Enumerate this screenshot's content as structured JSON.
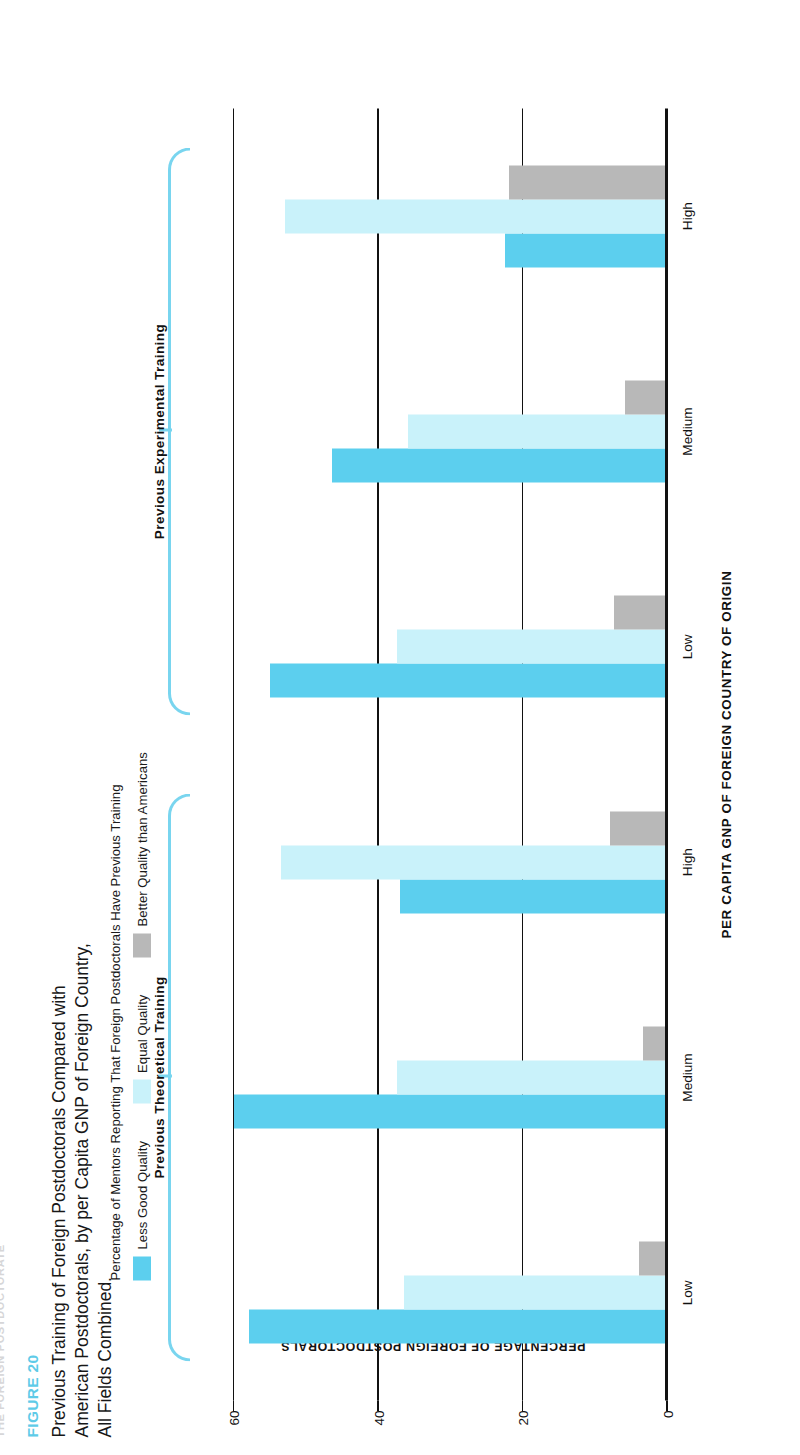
{
  "running_header": "THE FOREIGN POSTDOCTORATE",
  "caption": {
    "figure_number": "FIGURE 20",
    "title": "Previous Training of Foreign Postdoctorals Compared with American Postdoctorals, by per Capita GNP of Foreign Country, All Fields Combined."
  },
  "legend": {
    "header": "Percentage of Mentors Reporting That Foreign Postdoctorals Have Previous Training",
    "items": [
      {
        "label": "Less Good Quality",
        "color": "#5ccfee"
      },
      {
        "label": "Equal Quality",
        "color": "#c9f2fa"
      },
      {
        "label": "Better Quality than Americans",
        "color": "#b8b8b8"
      }
    ]
  },
  "axes": {
    "y_title": "PERCENTAGE OF FOREIGN POSTDOCTORALS",
    "x_title": "PER CAPITA GNP OF FOREIGN COUNTRY OF ORIGIN",
    "y_ticks": [
      "60",
      "40",
      "20",
      "0"
    ]
  },
  "group_titles": {
    "theoretical": "Previous Theoretical Training",
    "experimental": "Previous Experimental Training"
  },
  "chart_data": {
    "type": "bar",
    "title": "Previous Training of Foreign Postdoctorals Compared with American Postdoctorals, by per Capita GNP of Foreign Country, All Fields Combined.",
    "subtitle": "Percentage of Mentors Reporting That Foreign Postdoctorals Have Previous Training",
    "xlabel": "PER CAPITA GNP OF FOREIGN COUNTRY OF ORIGIN",
    "ylabel": "PERCENTAGE OF FOREIGN POSTDOCTORALS",
    "ylim": [
      0,
      65
    ],
    "yticks": [
      0,
      20,
      40,
      60
    ],
    "grid": true,
    "legend_position": "top",
    "orientation": "vertical",
    "supergroups": [
      {
        "name": "Previous Theoretical Training",
        "categories": [
          "Low",
          "Medium",
          "High"
        ],
        "series": [
          {
            "name": "Less Good Quality",
            "color": "#5ccfee",
            "values": [
              58,
              60,
              37
            ]
          },
          {
            "name": "Equal Quality",
            "color": "#c9f2fa",
            "values": [
              36.5,
              37.5,
              53.5
            ]
          },
          {
            "name": "Better Quality than Americans",
            "color": "#b8b8b8",
            "values": [
              4,
              3.5,
              8
            ]
          }
        ]
      },
      {
        "name": "Previous Experimental Training",
        "categories": [
          "Low",
          "Medium",
          "High"
        ],
        "series": [
          {
            "name": "Less Good Quality",
            "color": "#5ccfee",
            "values": [
              55,
              46.5,
              22.5
            ]
          },
          {
            "name": "Equal Quality",
            "color": "#c9f2fa",
            "values": [
              37.5,
              36,
              53
            ]
          },
          {
            "name": "Better Quality than Americans",
            "color": "#b8b8b8",
            "values": [
              7.5,
              6,
              22
            ]
          }
        ]
      }
    ]
  }
}
